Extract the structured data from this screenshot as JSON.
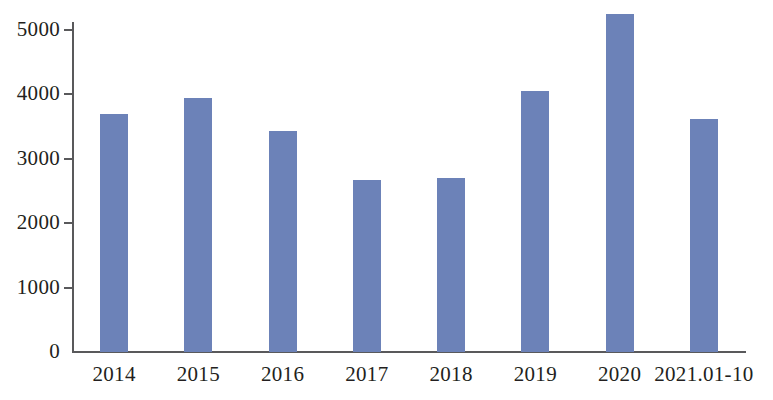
{
  "chart_data": {
    "type": "bar",
    "title": "",
    "xlabel": "",
    "ylabel": "",
    "categories": [
      "2014",
      "2015",
      "2016",
      "2017",
      "2018",
      "2019",
      "2020",
      "2021.01-10"
    ],
    "values": [
      3700,
      3950,
      3430,
      2670,
      2700,
      4050,
      5250,
      3620
    ],
    "series": [
      {
        "name": "",
        "values": [
          3700,
          3950,
          3430,
          2670,
          2700,
          4050,
          5250,
          3620
        ]
      }
    ],
    "ylim": [
      0,
      5400
    ],
    "ytick_values": [
      0,
      1000,
      2000,
      3000,
      4000,
      5000
    ],
    "ytick_labels": [
      "0",
      "1000",
      "2000",
      "3000",
      "4000",
      "5000"
    ],
    "grid": false,
    "legend": false,
    "legend_position": "none",
    "bar_color": "#6c82b8",
    "axis_color": "#59595b",
    "background_color": "#ffffff",
    "text_color": "#231f20"
  }
}
